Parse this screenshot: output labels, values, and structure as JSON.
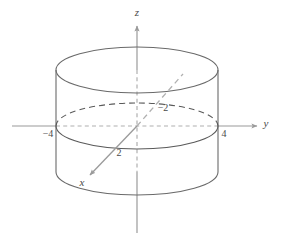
{
  "figure": {
    "background_color": "#ffffff",
    "axis_color": "#9a9a9a",
    "surface_color": "#5a5a5a",
    "label_color": "#4a4a4a",
    "width": 281,
    "height": 242
  },
  "axes": [
    {
      "id": "z",
      "label": "z",
      "label_x": 137,
      "label_y": 16,
      "direction": "up",
      "style": "solid-with-arrow"
    },
    {
      "id": "y",
      "label": "y",
      "label_x": 266,
      "label_y": 127,
      "direction": "right",
      "style": "solid-with-arrow"
    },
    {
      "id": "x",
      "label": "x",
      "label_x": 82,
      "label_y": 186,
      "direction": "down-left",
      "style": "solid-with-arrow-front-dashed-back"
    }
  ],
  "ticks": [
    {
      "id": "y-neg-4",
      "label": "−4",
      "x": 48,
      "y": 137,
      "axis": "y",
      "value": -4
    },
    {
      "id": "y-pos-4",
      "label": "4",
      "x": 223,
      "y": 137,
      "axis": "y",
      "value": 4
    },
    {
      "id": "x-neg-2",
      "label": "−2",
      "x": 163,
      "y": 111,
      "axis": "x",
      "value": -2
    },
    {
      "id": "x-pos-2",
      "label": "2",
      "x": 119,
      "y": 155,
      "axis": "x",
      "value": 2
    }
  ],
  "solid": {
    "kind": "cylinder",
    "center_x": 137,
    "center_y": 126,
    "radius_x": 81,
    "radius_y": 23,
    "top_y": 70,
    "bottom_y": 172,
    "left_x": 56,
    "right_x": 218,
    "y_intercepts": [
      -4,
      4
    ]
  },
  "origin": {
    "x": 137,
    "y": 126
  }
}
